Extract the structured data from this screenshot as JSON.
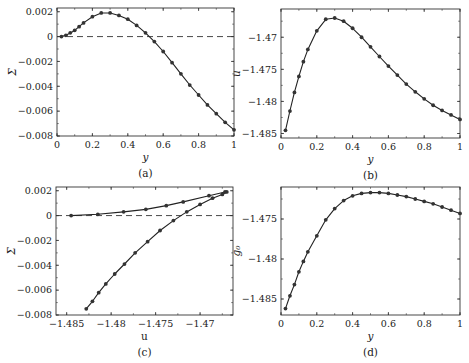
{
  "figure": {
    "panels": [
      {
        "id": "a",
        "caption": "(a)",
        "xlabel": "y",
        "ylabel": "Σ"
      },
      {
        "id": "b",
        "caption": "(b)",
        "xlabel": "y",
        "ylabel": "u"
      },
      {
        "id": "c",
        "caption": "(c)",
        "xlabel": "u",
        "ylabel": "Σ"
      },
      {
        "id": "d",
        "caption": "(d)",
        "xlabel": "y",
        "ylabel": "g₀"
      }
    ]
  },
  "chart_data": [
    {
      "panel": "a",
      "type": "line",
      "title": "",
      "caption": "(a)",
      "xlabel": "y",
      "ylabel": "Σ",
      "xlim": [
        0,
        1
      ],
      "ylim": [
        -0.008,
        0.0023
      ],
      "xticks": [
        0,
        0.2,
        0.4,
        0.6,
        0.8,
        1
      ],
      "xtick_labels": [
        "0",
        "0.2",
        "0.4",
        "0.6",
        "0.8",
        "1"
      ],
      "yticks": [
        0.002,
        0,
        -0.002,
        -0.004,
        -0.006,
        -0.008
      ],
      "ytick_labels": [
        "0.002",
        "0",
        "−0.002",
        "−0.004",
        "−0.006",
        "−0.008"
      ],
      "grid": false,
      "reference_line": {
        "y": 0,
        "style": "dashed"
      },
      "series": [
        {
          "name": "Σ(y)",
          "marker": "circle",
          "x": [
            0.025,
            0.05,
            0.075,
            0.1,
            0.125,
            0.15,
            0.2,
            0.25,
            0.3,
            0.35,
            0.4,
            0.45,
            0.5,
            0.55,
            0.6,
            0.65,
            0.7,
            0.75,
            0.8,
            0.85,
            0.9,
            0.95,
            1.0
          ],
          "y": [
            0.0,
            0.0001,
            0.0003,
            0.0005,
            0.0008,
            0.0011,
            0.0016,
            0.0019,
            0.0019,
            0.0017,
            0.0014,
            0.0009,
            0.0003,
            -0.0004,
            -0.0012,
            -0.0021,
            -0.003,
            -0.0039,
            -0.0047,
            -0.0055,
            -0.0062,
            -0.0069,
            -0.0075
          ]
        }
      ]
    },
    {
      "panel": "b",
      "type": "line",
      "title": "",
      "caption": "(b)",
      "xlabel": "y",
      "ylabel": "u",
      "xlim": [
        0,
        1
      ],
      "ylim": [
        -1.4857,
        -1.4656
      ],
      "xticks": [
        0,
        0.2,
        0.4,
        0.6,
        0.8,
        1
      ],
      "xtick_labels": [
        "0",
        "0.2",
        "0.4",
        "0.6",
        "0.8",
        "1"
      ],
      "yticks": [
        -1.47,
        -1.475,
        -1.48,
        -1.485
      ],
      "ytick_labels": [
        "−1.47",
        "−1.475",
        "−1.48",
        "−1.485"
      ],
      "grid": false,
      "series": [
        {
          "name": "u(y)",
          "marker": "circle",
          "x": [
            0.025,
            0.05,
            0.075,
            0.1,
            0.125,
            0.15,
            0.2,
            0.25,
            0.3,
            0.35,
            0.4,
            0.45,
            0.5,
            0.55,
            0.6,
            0.65,
            0.7,
            0.75,
            0.8,
            0.85,
            0.9,
            0.95,
            1.0
          ],
          "y": [
            -1.4845,
            -1.4815,
            -1.4786,
            -1.4761,
            -1.4738,
            -1.4719,
            -1.469,
            -1.4672,
            -1.467,
            -1.4675,
            -1.4686,
            -1.47,
            -1.4715,
            -1.473,
            -1.4745,
            -1.4759,
            -1.4773,
            -1.4785,
            -1.4796,
            -1.4806,
            -1.4814,
            -1.4821,
            -1.4828
          ]
        }
      ]
    },
    {
      "panel": "c",
      "type": "line",
      "title": "",
      "caption": "(c)",
      "xlabel": "u",
      "ylabel": "Σ",
      "xlim": [
        -1.4862,
        -1.4663
      ],
      "ylim": [
        -0.008,
        0.0023
      ],
      "xticks": [
        -1.485,
        -1.48,
        -1.475,
        -1.47
      ],
      "xtick_labels": [
        "−1.485",
        "−1.48",
        "−1.475",
        "−1.47"
      ],
      "yticks": [
        0.002,
        0,
        -0.002,
        -0.004,
        -0.006,
        -0.008
      ],
      "ytick_labels": [
        "0.002",
        "0",
        "−0.002",
        "−0.004",
        "−0.006",
        "−0.008"
      ],
      "grid": false,
      "reference_line": {
        "y": 0,
        "style": "dashed"
      },
      "series": [
        {
          "name": "Σ vs u (parametric in y)",
          "marker": "circle",
          "x": [
            -1.4845,
            -1.4815,
            -1.4786,
            -1.4761,
            -1.4738,
            -1.4719,
            -1.469,
            -1.4672,
            -1.467,
            -1.4675,
            -1.4686,
            -1.47,
            -1.4715,
            -1.473,
            -1.4745,
            -1.4759,
            -1.4773,
            -1.4785,
            -1.4796,
            -1.4806,
            -1.4814,
            -1.4821,
            -1.4828
          ],
          "y": [
            0.0,
            0.0001,
            0.0003,
            0.0005,
            0.0008,
            0.0011,
            0.0016,
            0.0019,
            0.0019,
            0.0017,
            0.0014,
            0.0009,
            0.0003,
            -0.0004,
            -0.0012,
            -0.0021,
            -0.003,
            -0.0039,
            -0.0047,
            -0.0055,
            -0.0062,
            -0.0069,
            -0.0075
          ]
        }
      ]
    },
    {
      "panel": "d",
      "type": "line",
      "title": "",
      "caption": "(d)",
      "xlabel": "y",
      "ylabel": "g₀",
      "xlim": [
        0,
        1
      ],
      "ylim": [
        -1.487,
        -1.471
      ],
      "xticks": [
        0,
        0.2,
        0.4,
        0.6,
        0.8,
        1
      ],
      "xtick_labels": [
        "0",
        "0.2",
        "0.4",
        "0.6",
        "0.8",
        "1"
      ],
      "yticks": [
        -1.475,
        -1.48,
        -1.485
      ],
      "ytick_labels": [
        "−1.475",
        "−1.48",
        "−1.485"
      ],
      "grid": false,
      "series": [
        {
          "name": "g₀(y)",
          "marker": "circle",
          "x": [
            0.025,
            0.05,
            0.075,
            0.1,
            0.125,
            0.15,
            0.2,
            0.25,
            0.3,
            0.35,
            0.4,
            0.45,
            0.5,
            0.55,
            0.6,
            0.65,
            0.7,
            0.75,
            0.8,
            0.85,
            0.9,
            0.95,
            1.0
          ],
          "y": [
            -1.4862,
            -1.4846,
            -1.4832,
            -1.4816,
            -1.4803,
            -1.4791,
            -1.4771,
            -1.4751,
            -1.4737,
            -1.4727,
            -1.4721,
            -1.4718,
            -1.4717,
            -1.4717,
            -1.4718,
            -1.472,
            -1.4722,
            -1.4725,
            -1.4728,
            -1.4731,
            -1.4735,
            -1.4739,
            -1.4743
          ]
        }
      ]
    }
  ],
  "layout": {
    "panels": {
      "a": {
        "left": 57,
        "right": 234,
        "top": 8,
        "bottom": 136
      },
      "b": {
        "left": 281,
        "right": 460,
        "top": 9,
        "bottom": 138
      },
      "c": {
        "left": 56,
        "right": 233,
        "top": 187,
        "bottom": 315
      },
      "d": {
        "left": 281,
        "right": 460,
        "top": 187,
        "bottom": 315
      }
    },
    "line_color": "#222222",
    "marker_color": "#333333"
  }
}
